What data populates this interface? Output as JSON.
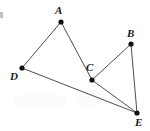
{
  "figure": {
    "kind": "geometry-point-diagram",
    "width": 150,
    "height": 131,
    "background_color": "#ffffff",
    "line_color": "#3a3a3a",
    "dot_color": "#111111",
    "label_color": "#1a1a1a"
  },
  "points": [
    {
      "label": "A",
      "x": 61,
      "y": 22,
      "label_x": 55,
      "label_y": 5
    },
    {
      "label": "B",
      "x": 131,
      "y": 44,
      "label_x": 127,
      "label_y": 28
    },
    {
      "label": "C",
      "x": 92,
      "y": 80,
      "label_x": 86,
      "label_y": 62
    },
    {
      "label": "D",
      "x": 22,
      "y": 68,
      "label_x": 10,
      "label_y": 71
    },
    {
      "label": "E",
      "x": 137,
      "y": 113,
      "label_x": 135,
      "label_y": 117
    }
  ],
  "edges": [
    {
      "name": "segment-DA",
      "from": "D",
      "to": "A"
    },
    {
      "name": "segment-AC",
      "from": "A",
      "to": "C"
    },
    {
      "name": "segment-CB",
      "from": "C",
      "to": "B"
    },
    {
      "name": "segment-BE",
      "from": "B",
      "to": "E"
    },
    {
      "name": "segment-CE",
      "from": "C",
      "to": "E"
    },
    {
      "name": "segment-DE",
      "from": "D",
      "to": "E"
    }
  ],
  "artifacts": {
    "left_edge_mark": {
      "x": 0,
      "y": 12,
      "width": 3,
      "height": 6
    }
  }
}
